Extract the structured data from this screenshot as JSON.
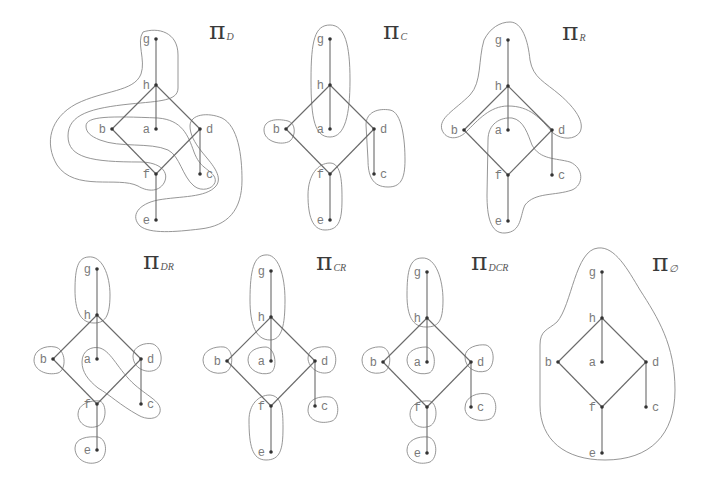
{
  "figure": {
    "colors": {
      "edge": "#6a6a6a",
      "block": "#8a8a8a",
      "dot": "#333333",
      "label": "#7a7a7a",
      "title": "#3a3a3a"
    }
  },
  "lattice": {
    "nodes": [
      {
        "id": "g",
        "label": "g",
        "dx": 0,
        "dy": 0,
        "side": "left"
      },
      {
        "id": "h",
        "label": "h",
        "dx": 0,
        "dy": 46,
        "side": "left"
      },
      {
        "id": "b",
        "label": "b",
        "dx": -44,
        "dy": 90,
        "side": "left"
      },
      {
        "id": "a",
        "label": "a",
        "dx": 0,
        "dy": 90,
        "side": "left"
      },
      {
        "id": "d",
        "label": "d",
        "dx": 44,
        "dy": 90,
        "side": "right"
      },
      {
        "id": "f",
        "label": "f",
        "dx": 0,
        "dy": 135,
        "side": "left"
      },
      {
        "id": "c",
        "label": "c",
        "dx": 44,
        "dy": 135,
        "side": "right"
      },
      {
        "id": "e",
        "label": "e",
        "dx": 0,
        "dy": 181,
        "side": "left"
      }
    ],
    "edges": [
      [
        "g",
        "h"
      ],
      [
        "h",
        "a"
      ],
      [
        "h",
        "b"
      ],
      [
        "h",
        "d"
      ],
      [
        "b",
        "f"
      ],
      [
        "d",
        "f"
      ],
      [
        "d",
        "c"
      ],
      [
        "f",
        "e"
      ]
    ]
  },
  "panels": [
    {
      "id": "pi-D",
      "symbol": "π",
      "subscript": "D",
      "origin": [
        156,
        39
      ],
      "title_pos": [
        209,
        39
      ],
      "blocks": [
        [
          "g",
          "h",
          "f"
        ],
        [
          "b",
          "a",
          "c"
        ],
        [
          "d",
          "e"
        ]
      ],
      "paths": [
        "M 143,32 C 158,27 178,32 178,55 L 178,88 C 178,101 160,101 130,104 C 92,108 68,114 68,136 C 68,158 92,162 140,162 C 160,162 170,172 164,183 C 158,193 146,191 138,186 C 118,176 75,192 57,165 C 44,143 50,118 76,104 C 104,90 134,92 141,74 C 146,60 136,42 143,32 Z",
        "M 86,126 C 86,116 110,116 158,118 C 182,120 188,135 194,152 C 200,168 208,168 214,176 C 220,186 204,194 194,186 C 182,176 180,156 168,150 C 150,142 120,148 100,140 C 90,136 86,132 86,126 Z",
        "M 190,126 C 190,114 208,112 222,118 C 238,126 242,155 242,180 C 242,210 228,226 200,229 C 175,232 150,234 140,226 C 130,216 138,204 158,200 C 180,196 206,198 216,186 C 224,176 210,162 202,152 C 194,142 190,134 190,126 Z"
      ]
    },
    {
      "id": "pi-C",
      "symbol": "π",
      "subscript": "C",
      "origin": [
        330,
        39
      ],
      "title_pos": [
        383,
        39
      ],
      "blocks": [
        [
          "g",
          "h",
          "a"
        ],
        [
          "b"
        ],
        [
          "d",
          "c"
        ],
        [
          "f",
          "e"
        ]
      ],
      "paths": [
        "M 330,25 C 345,25 350,45 350,80 C 350,115 345,137 330,137 C 315,137 311,120 311,80 C 311,40 315,25 330,25 Z",
        "M 264,130 C 264,120 276,118 288,121 C 296,123 296,136 290,141 C 282,146 264,142 264,130 Z",
        "M 366,125 C 366,112 378,108 390,110 C 402,112 405,140 405,160 C 405,180 400,187 388,187 C 372,187 368,175 368,160 Z",
        "M 308,195 C 308,175 318,163 330,163 C 342,163 342,185 342,200 C 342,222 338,230 325,230 C 312,230 308,215 308,195 Z"
      ]
    },
    {
      "id": "pi-R",
      "symbol": "π",
      "subscript": "R",
      "origin": [
        508,
        40
      ],
      "title_pos": [
        562,
        40
      ],
      "blocks": [
        [
          "g",
          "h",
          "b",
          "d"
        ],
        [
          "a",
          "f",
          "e",
          "c"
        ]
      ],
      "paths": [
        "M 510,22 C 522,22 528,40 530,60 C 533,78 545,82 560,95 C 575,108 585,122 580,132 C 575,140 562,140 553,133 C 540,118 530,106 508,106 C 490,106 478,120 466,132 C 458,140 446,140 442,130 C 438,118 455,110 470,95 C 482,82 478,60 484,40 C 490,28 500,22 510,22 Z",
        "M 488,140 C 488,124 500,117 512,118 C 524,120 528,135 532,145 C 540,160 556,158 570,162 C 584,168 584,185 572,190 C 555,196 535,192 525,205 C 520,215 522,232 505,233 C 490,234 487,215 487,195 Z"
      ]
    },
    {
      "id": "pi-DR",
      "symbol": "π",
      "subscript": "DR",
      "origin": [
        97,
        269
      ],
      "title_pos": [
        143,
        269
      ],
      "blocks": [
        [
          "g",
          "h"
        ],
        [
          "b"
        ],
        [
          "a",
          "c"
        ],
        [
          "d"
        ],
        [
          "f"
        ],
        [
          "e"
        ]
      ],
      "paths": [
        "M 88,257 C 102,255 110,275 110,295 C 110,318 104,323 94,323 C 80,323 75,310 75,290 C 75,268 78,258 88,257 Z",
        "M 34,360 C 34,350 45,345 55,347 C 66,349 67,370 58,373 C 46,376 34,370 34,360 Z",
        "M 82,362 C 82,350 92,346 100,348 C 112,352 118,370 135,385 C 150,398 162,402 160,412 C 158,420 146,420 138,415 C 120,405 110,395 98,388 C 88,380 82,372 82,362 Z",
        "M 133,356 C 133,346 145,342 153,344 C 163,348 164,366 155,370 C 146,374 133,368 133,356 Z",
        "M 78,414 C 78,404 90,400 100,401 C 107,404 107,422 98,426 C 88,430 78,424 78,414 Z",
        "M 75,448 C 75,438 88,436 98,437 C 108,439 108,458 98,462 C 88,466 75,460 75,448 Z"
      ]
    },
    {
      "id": "pi-CR",
      "symbol": "π",
      "subscript": "CR",
      "origin": [
        271,
        271
      ],
      "title_pos": [
        316,
        270
      ],
      "blocks": [
        [
          "g",
          "h"
        ],
        [
          "b"
        ],
        [
          "a"
        ],
        [
          "d"
        ],
        [
          "c"
        ],
        [
          "f",
          "e"
        ]
      ],
      "paths": [
        "M 265,255 C 278,253 285,275 285,300 C 285,325 282,340 270,340 C 256,340 250,325 250,300 C 250,270 254,256 265,255 Z",
        "M 203,360 C 203,350 215,346 224,347 C 234,349 234,368 226,372 C 215,376 203,370 203,360 Z",
        "M 248,360 C 248,350 258,347 266,347 C 276,348 278,370 270,373 C 260,376 248,370 248,360 Z",
        "M 308,358 C 308,348 320,346 328,347 C 338,349 338,368 330,372 C 320,376 308,368 308,358 Z",
        "M 308,410 C 308,398 320,396 330,397 C 340,399 340,418 332,421 C 320,425 308,420 308,410 Z",
        "M 249,420 C 249,405 258,395 270,395 C 282,396 283,410 283,428 C 283,450 280,460 266,460 C 252,460 249,445 249,420 Z"
      ]
    },
    {
      "id": "pi-DCR",
      "symbol": "π",
      "subscript": "DCR",
      "origin": [
        427,
        272
      ],
      "title_pos": [
        471,
        270
      ],
      "blocks": [
        [
          "g",
          "h"
        ],
        [
          "b"
        ],
        [
          "a"
        ],
        [
          "d"
        ],
        [
          "c"
        ],
        [
          "f"
        ],
        [
          "e"
        ]
      ],
      "paths": [
        "M 422,258 C 436,257 443,280 443,300 C 443,322 438,327 426,327 C 412,327 407,315 407,295 C 407,270 410,258 422,258 Z",
        "M 362,360 C 362,350 374,346 382,347 C 392,349 392,368 384,372 C 372,376 362,370 362,360 Z",
        "M 407,360 C 407,350 418,347 426,347 C 436,348 437,370 429,373 C 418,376 407,370 407,360 Z",
        "M 465,357 C 465,347 478,344 486,345 C 496,348 495,368 486,371 C 476,374 465,368 465,357 Z",
        "M 465,408 C 465,396 478,392 488,394 C 498,397 498,416 490,419 C 478,423 465,418 465,408 Z",
        "M 410,414 C 410,404 420,400 430,401 C 438,404 438,422 430,426 C 420,430 410,424 410,414 Z",
        "M 407,450 C 407,440 418,436 428,437 C 438,439 438,458 430,462 C 418,466 407,460 407,450 Z"
      ]
    },
    {
      "id": "pi-empty",
      "symbol": "π",
      "subscript": "∅",
      "origin": [
        602,
        272
      ],
      "title_pos": [
        652,
        271
      ],
      "blocks": [
        [
          "g",
          "h",
          "b",
          "a",
          "d",
          "f",
          "c",
          "e"
        ]
      ],
      "paths": [
        "M 598,248 C 615,246 628,270 640,290 C 658,318 675,345 675,390 C 675,435 650,460 605,460 C 565,460 540,440 540,405 L 540,345 C 540,330 548,330 557,322 C 572,305 575,250 598,248 Z"
      ]
    }
  ]
}
